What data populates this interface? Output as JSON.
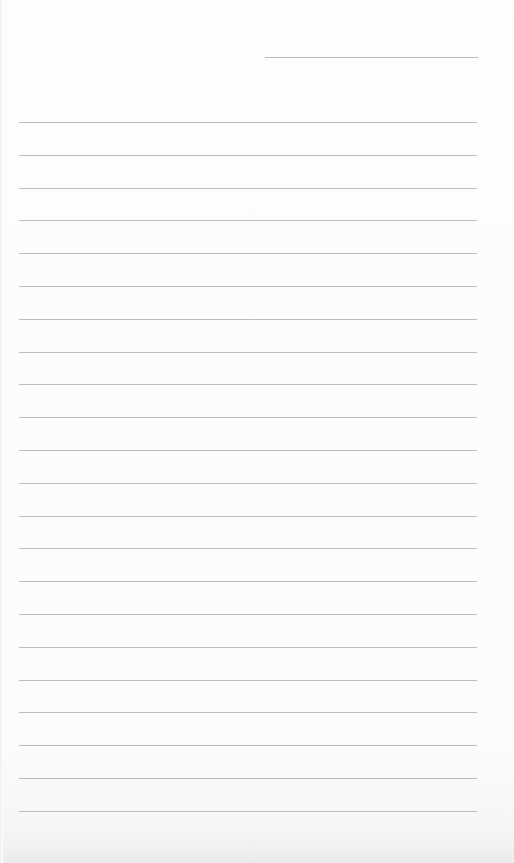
{
  "page": {
    "type": "lined-paper",
    "background_color": "#fdfdfd",
    "line_color": "#bcbcbc",
    "header_line": {
      "label": "",
      "left": 265,
      "top": 57,
      "width": 213
    },
    "rules": {
      "count": 22,
      "first_top": 122,
      "spacing": 32.8,
      "left": 19,
      "width": 458
    },
    "text_content": []
  }
}
